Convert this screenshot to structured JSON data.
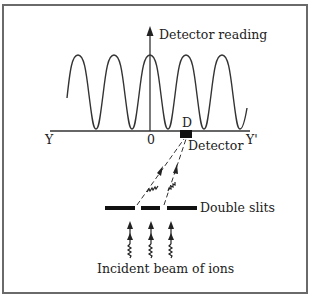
{
  "diagram": {
    "axis": {
      "vertical_label": "Detector reading",
      "left_label": "Y",
      "right_label": "Y'",
      "origin_label": "0"
    },
    "detector": {
      "marker_label": "D",
      "label": "Detector"
    },
    "slits": {
      "label": "Double slits"
    },
    "source": {
      "label": "Incident beam of ions"
    },
    "colors": {
      "ink": "#222222",
      "frame": "#6a6a6a"
    }
  }
}
